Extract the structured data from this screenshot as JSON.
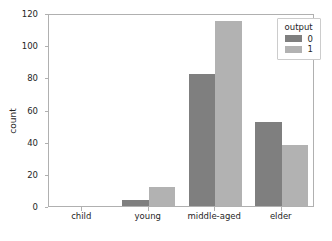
{
  "chart_data": {
    "type": "bar",
    "title": "",
    "xlabel": "",
    "ylabel": "count",
    "categories": [
      "child",
      "young",
      "middle-aged",
      "elder"
    ],
    "series": [
      {
        "name": "0",
        "values": [
          0,
          4,
          82,
          52
        ],
        "color": "#7f7f7f"
      },
      {
        "name": "1",
        "values": [
          0,
          12,
          115,
          38
        ],
        "color": "#b2b2b2"
      }
    ],
    "ylim": [
      0,
      120
    ],
    "yticks": [
      0,
      20,
      40,
      60,
      80,
      100,
      120
    ],
    "ytick_labels": [
      "0",
      "20",
      "40",
      "60",
      "80",
      "100",
      "120"
    ],
    "grid": false,
    "legend": {
      "title": "output",
      "position": "upper right",
      "entries": [
        {
          "label": "0",
          "color": "#7f7f7f"
        },
        {
          "label": "1",
          "color": "#b2b2b2"
        }
      ]
    }
  }
}
